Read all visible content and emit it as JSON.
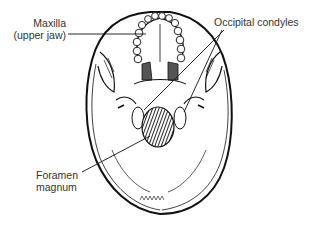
{
  "figure": {
    "labels": {
      "maxilla": {
        "line1": "Maxilla",
        "line2": "(upper jaw)"
      },
      "occipital_condyles": {
        "line1": "Occipital condyles"
      },
      "foramen_magnum": {
        "line1": "Foramen",
        "line2": "magnum"
      }
    }
  }
}
